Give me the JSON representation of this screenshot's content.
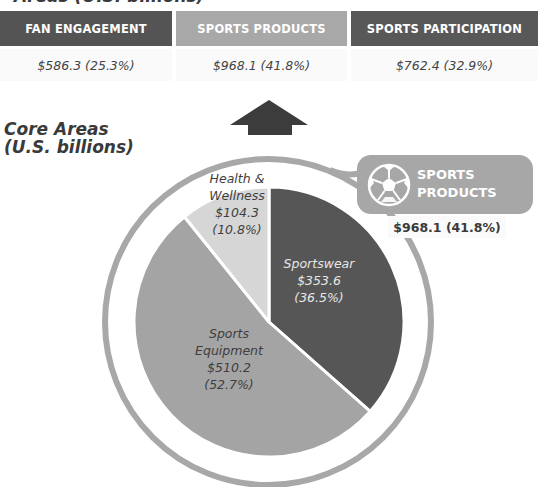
{
  "page": {
    "clipped_heading": "Areas (U.S. billions)"
  },
  "segments": [
    {
      "label": "FAN ENGAGEMENT",
      "value": "$586.3 (25.3%)",
      "color": "#545454"
    },
    {
      "label": "SPORTS PRODUCTS",
      "value": "$968.1 (41.8%)",
      "color": "#a8a8a8"
    },
    {
      "label": "SPORTS PARTICIPATION",
      "value": "$762.4 (32.9%)",
      "color": "#585858"
    }
  ],
  "core_title": {
    "line1": "Core Areas",
    "line2": "(U.S. billions)"
  },
  "arrow": {
    "icon": "up-arrow-icon",
    "color": "#3c3c3c"
  },
  "callout": {
    "icon": "soccer-ball-icon",
    "line1": "SPORTS",
    "line2": "PRODUCTS",
    "value": "$968.1 (41.8%)",
    "color": "#a7a7a7"
  },
  "chart_data": {
    "type": "pie",
    "title": "Sports Products",
    "total": 968.1,
    "units": "U.S. billions",
    "start": "12 o'clock, clockwise",
    "slices": [
      {
        "name": "Sportswear",
        "value": 353.6,
        "percent": 36.5,
        "value_label": "$353.6",
        "percent_label": "(36.5%)",
        "color": "#565656",
        "text_color": "#e6e6e6"
      },
      {
        "name": "Sports Equipment",
        "name_lines": [
          "Sports",
          "Equipment"
        ],
        "value": 510.2,
        "percent": 52.7,
        "value_label": "$510.2",
        "percent_label": "(52.7%)",
        "color": "#a4a4a4",
        "text_color": "#3e3e3e"
      },
      {
        "name": "Health & Wellness",
        "name_lines": [
          "Health &",
          "Wellness"
        ],
        "value": 104.3,
        "percent": 10.8,
        "value_label": "$104.3",
        "percent_label": "(10.8%)",
        "color": "#d6d6d6",
        "text_color": "#3e3e3e"
      }
    ],
    "ring_color": "#a8a8a8"
  }
}
